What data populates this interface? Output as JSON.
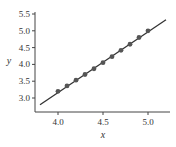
{
  "chart_data": {
    "type": "scatter",
    "title": "",
    "xlabel": "x",
    "ylabel": "y",
    "xlim": [
      3.75,
      5.3
    ],
    "ylim": [
      2.65,
      5.55
    ],
    "xticks": [
      4.0,
      4.5,
      5.0
    ],
    "xtick_labels": [
      "4.0",
      "4.5",
      "5.0"
    ],
    "yticks": [
      3.0,
      3.5,
      4.0,
      4.5,
      5.0,
      5.5
    ],
    "ytick_labels": [
      "3.0",
      "3.5",
      "4.0",
      "4.5",
      "5.0",
      "5.5"
    ],
    "grid": false,
    "legend": null,
    "series": [
      {
        "name": "data",
        "kind": "scatter",
        "color": "#555555",
        "x": [
          4.0,
          4.1,
          4.2,
          4.3,
          4.4,
          4.5,
          4.6,
          4.7,
          4.8,
          4.9,
          5.0
        ],
        "y": [
          3.2,
          3.36,
          3.53,
          3.7,
          3.87,
          4.05,
          4.23,
          4.42,
          4.6,
          4.8,
          5.0
        ]
      },
      {
        "name": "fit line",
        "kind": "line",
        "color": "#333333",
        "x": [
          3.8,
          5.2
        ],
        "y": [
          2.8,
          5.33
        ]
      }
    ]
  }
}
